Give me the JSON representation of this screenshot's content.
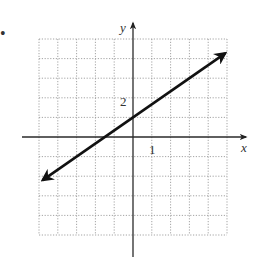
{
  "chart_data": {
    "type": "line",
    "title": "",
    "xlabel": "x",
    "ylabel": "y",
    "xlim": [
      -5,
      5
    ],
    "ylim": [
      -5,
      5
    ],
    "grid": true,
    "grid_style": "dotted",
    "tick_labels": {
      "x": [
        "1"
      ],
      "y": [
        "2"
      ]
    },
    "series": [
      {
        "name": "line",
        "equation": "y = (2/3)x + 1",
        "slope": 0.6667,
        "y_intercept": 1,
        "x_intercept": -1.5,
        "arrows": "both",
        "endpoints": [
          [
            -4.8,
            -2.2
          ],
          [
            4.9,
            4.27
          ]
        ],
        "x": [
          -4.8,
          -1.5,
          0,
          3,
          4.9
        ],
        "values": [
          -2.2,
          0,
          1,
          3,
          4.27
        ]
      }
    ],
    "legend": null
  },
  "labels": {
    "x_axis": "x",
    "y_axis": "y",
    "x_tick": "1",
    "y_tick": "2",
    "bullet": "•"
  }
}
